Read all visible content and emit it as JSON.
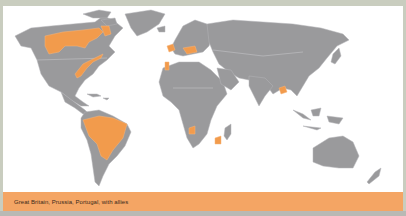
{
  "map": {
    "title": "World map of alliances",
    "colors": {
      "land": "#9a9a9c",
      "highlight": "#f29b4c",
      "ocean": "#ffffff",
      "frame": "#c9cdbf"
    },
    "highlighted_regions": [
      "British North America (Canada, Hudson Bay region)",
      "British North American colonies (East coast)",
      "Great Britain",
      "Prussia",
      "Portugal",
      "Brazil",
      "Bengal (India)",
      "Angola",
      "Mozambique"
    ]
  },
  "legend": {
    "label": "Great Britain, Prussia, Portugal, with allies",
    "color": "#f4a564"
  }
}
